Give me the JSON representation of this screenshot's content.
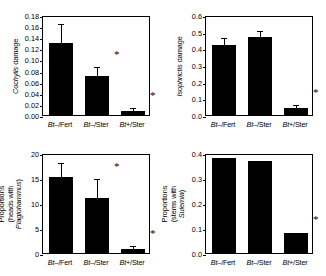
{
  "figure": {
    "panels": [
      {
        "id": "cochylis-damage",
        "ylabel": "Cochylis damage",
        "ylabel_italic_part": "Cochylis",
        "ylabel_plain_part": " damage",
        "ylabel_lines": 1,
        "yticks": [
          "0.00",
          "0.02",
          "0.04",
          "0.06",
          "0.08",
          "0.10",
          "0.12",
          "0.14",
          "0.16",
          "0.18"
        ],
        "ymin": 0,
        "ymax": 0.18,
        "ystep": 0.02,
        "categories": [
          "Bt–/Fert",
          "Bt–/Ster",
          "Bt+/Ster"
        ],
        "values": [
          0.13,
          0.07,
          0.007
        ],
        "errors": [
          0.032,
          0.014,
          0.004
        ],
        "stars": [
          false,
          true,
          true
        ]
      },
      {
        "id": "isophrictis-damage",
        "ylabel": "Isophrictis damage",
        "ylabel_italic_part": "Isophrictis",
        "ylabel_plain_part": " damage",
        "ylabel_lines": 1,
        "yticks": [
          "0.0",
          "0.1",
          "0.2",
          "0.3",
          "0.4",
          "0.5",
          "0.6"
        ],
        "ymin": 0,
        "ymax": 0.6,
        "ystep": 0.1,
        "categories": [
          "Bt–/Fert",
          "Bt–/Ster",
          "Bt+/Ster"
        ],
        "values": [
          0.42,
          0.47,
          0.04
        ],
        "errors": [
          0.035,
          0.031,
          0.012
        ],
        "stars": [
          false,
          false,
          true
        ]
      },
      {
        "id": "plagiohammus-proportions",
        "ylabel": "Proportions\n(heads with Plagiohammus)",
        "ylabel_line1": "Proportions",
        "ylabel_line2_plain": "(heads with ",
        "ylabel_line2_italic": "Plagiohammus",
        "ylabel_line2_tail": ")",
        "ylabel_lines": 2,
        "yticks": [
          "0",
          "5",
          "10",
          "15",
          "20"
        ],
        "ymin": 0,
        "ymax": 20,
        "ystep": 5,
        "categories": [
          "Bt–/Fert",
          "Bt–/Ster",
          "Bt+/Ster"
        ],
        "values": [
          15.3,
          11.1,
          0.8
        ],
        "errors": [
          2.6,
          3.6,
          0.5
        ],
        "stars": [
          false,
          true,
          true
        ]
      },
      {
        "id": "sulemia-proportions",
        "ylabel": "Proportions\n(stems with Sulemia)",
        "ylabel_line1": "Proportions",
        "ylabel_line2_plain": "(stems with ",
        "ylabel_line2_italic": "Sulemia",
        "ylabel_line2_tail": ")",
        "ylabel_lines": 2,
        "yticks": [
          "0.0",
          "0.1",
          "0.2",
          "0.3",
          "0.4"
        ],
        "ymin": 0,
        "ymax": 0.4,
        "ystep": 0.1,
        "categories": [
          "Bt–/Fert",
          "Bt–/Ster",
          "Bt+/Ster"
        ],
        "values": [
          0.38,
          0.37,
          0.08
        ],
        "errors": [
          0,
          0,
          0
        ],
        "stars": [
          false,
          false,
          true
        ]
      }
    ]
  },
  "chart_data": [
    {
      "type": "bar",
      "title": "",
      "xlabel": "",
      "ylabel": "Cochylis damage",
      "categories": [
        "Bt–/Fert",
        "Bt–/Ster",
        "Bt+/Ster"
      ],
      "values": [
        0.13,
        0.07,
        0.007
      ],
      "errors": [
        0.032,
        0.014,
        0.004
      ],
      "annotations": [
        "",
        "*",
        "*"
      ],
      "ylim": [
        0,
        0.18
      ],
      "ytick_step": 0.02,
      "grid": false,
      "legend": "none",
      "bar_color": "#000000"
    },
    {
      "type": "bar",
      "title": "",
      "xlabel": "",
      "ylabel": "Isophrictis damage",
      "categories": [
        "Bt–/Fert",
        "Bt–/Ster",
        "Bt+/Ster"
      ],
      "values": [
        0.42,
        0.47,
        0.04
      ],
      "errors": [
        0.035,
        0.031,
        0.012
      ],
      "annotations": [
        "",
        "",
        "*"
      ],
      "ylim": [
        0,
        0.6
      ],
      "ytick_step": 0.1,
      "grid": false,
      "legend": "none",
      "bar_color": "#000000"
    },
    {
      "type": "bar",
      "title": "",
      "xlabel": "",
      "ylabel": "Proportions (heads with Plagiohammus)",
      "categories": [
        "Bt–/Fert",
        "Bt–/Ster",
        "Bt+/Ster"
      ],
      "values": [
        15.3,
        11.1,
        0.8
      ],
      "errors": [
        2.6,
        3.6,
        0.5
      ],
      "annotations": [
        "",
        "*",
        "*"
      ],
      "ylim": [
        0,
        20
      ],
      "ytick_step": 5,
      "grid": false,
      "legend": "none",
      "bar_color": "#000000"
    },
    {
      "type": "bar",
      "title": "",
      "xlabel": "",
      "ylabel": "Proportions (stems with Sulemia)",
      "categories": [
        "Bt–/Fert",
        "Bt–/Ster",
        "Bt+/Ster"
      ],
      "values": [
        0.38,
        0.37,
        0.08
      ],
      "errors": [
        0,
        0,
        0
      ],
      "annotations": [
        "",
        "",
        "*"
      ],
      "ylim": [
        0,
        0.4
      ],
      "ytick_step": 0.1,
      "grid": false,
      "legend": "none",
      "bar_color": "#000000"
    }
  ]
}
